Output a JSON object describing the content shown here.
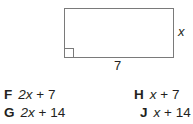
{
  "figure": {
    "shape": "rectangle",
    "side_label_right": "x",
    "side_label_bottom": "7",
    "right_angle_marker": "bottom-left"
  },
  "options": [
    {
      "letter": "F",
      "expr_var": "2x",
      "expr_rest": " + 7"
    },
    {
      "letter": "G",
      "expr_var": "2x",
      "expr_rest": " + 14"
    },
    {
      "letter": "H",
      "expr_var": "x",
      "expr_rest": " + 7"
    },
    {
      "letter": "J",
      "expr_var": "x",
      "expr_rest": " + 14"
    }
  ]
}
